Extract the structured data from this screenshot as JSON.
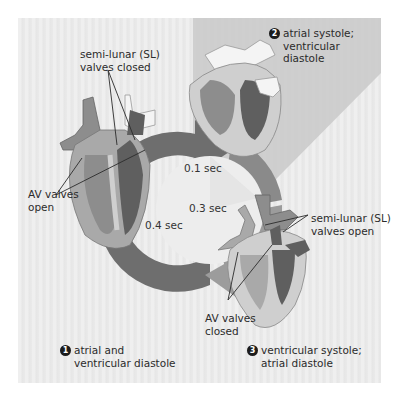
{
  "figure": {
    "colors": {
      "panel_bg": "#ececec",
      "stage2_triangle": "#c9c9c9",
      "ring_diastole": "#6e6e6e",
      "ring_atrial_systole": "#8a8a8a",
      "ring_ventricular_systole": "#9c9c9c",
      "heart_outer": "#a9a9a9",
      "heart_wall": "#cfcfcf",
      "chamber_dark": "#5f5f5f",
      "chamber_mid": "#8d8d8d",
      "vessel": "#f4f4f4"
    }
  },
  "stages": [
    {
      "number": "1",
      "label": "atrial and\nventricular diastole"
    },
    {
      "number": "2",
      "label": "atrial systole;\nventricular\ndiastole"
    },
    {
      "number": "3",
      "label": "ventricular systole;\natrial diastole"
    }
  ],
  "timings": {
    "t1": "0.1 sec",
    "t2": "0.3 sec",
    "t3": "0.4 sec"
  },
  "annotations": {
    "sl_closed": "semi-lunar (SL)\nvalves closed",
    "av_open": "AV valves\nopen",
    "sl_open": "semi-lunar (SL)\nvalves open",
    "av_closed": "AV valves\nclosed"
  }
}
